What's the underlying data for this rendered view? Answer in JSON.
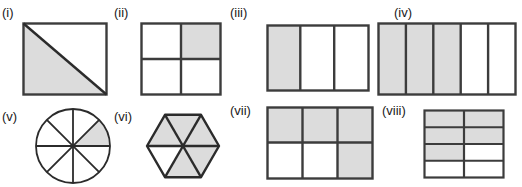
{
  "page": {
    "background": "#ffffff",
    "shade_color": "#dcdcdc",
    "stroke_color": "#3c3c3c",
    "label_color": "#1a1a1a"
  },
  "figures": [
    {
      "id": "i",
      "label": "(i)",
      "shape": "square-diagonal",
      "description": "Square divided by a diagonal from top-left to bottom-right; lower-left triangle shaded",
      "total_parts": 2,
      "shaded_parts": 1,
      "fraction": "1/2",
      "shaded": [
        true,
        false
      ]
    },
    {
      "id": "ii",
      "label": "(ii)",
      "shape": "grid",
      "description": "Square divided into a 2 by 2 grid; top-right cell shaded",
      "columns": 2,
      "rows": 2,
      "total_parts": 4,
      "shaded_parts": 1,
      "fraction": "1/4",
      "shaded": [
        false,
        true,
        false,
        false
      ]
    },
    {
      "id": "iii",
      "label": "(iii)",
      "shape": "grid",
      "description": "Rectangle divided into 3 vertical strips; leftmost strip shaded",
      "columns": 3,
      "rows": 1,
      "total_parts": 3,
      "shaded_parts": 1,
      "fraction": "1/3",
      "shaded": [
        true,
        false,
        false
      ]
    },
    {
      "id": "iv",
      "label": "(iv)",
      "shape": "grid",
      "description": "Rectangle divided into 5 vertical strips; first three strips shaded",
      "columns": 5,
      "rows": 1,
      "total_parts": 5,
      "shaded_parts": 3,
      "fraction": "3/5",
      "shaded": [
        true,
        true,
        true,
        false,
        false
      ]
    },
    {
      "id": "v",
      "label": "(v)",
      "shape": "circle-sectors",
      "description": "Circle divided into 8 equal sectors; one sector shaded",
      "total_parts": 8,
      "shaded_parts": 1,
      "fraction": "1/8",
      "shaded": [
        true,
        false,
        false,
        false,
        false,
        false,
        false,
        false
      ]
    },
    {
      "id": "vi",
      "label": "(vi)",
      "shape": "hexagon-triangles",
      "description": "Regular hexagon divided into 6 triangles; five shaded, the lower-left triangle unshaded",
      "total_parts": 6,
      "shaded_parts": 5,
      "fraction": "5/6",
      "shaded": [
        true,
        true,
        true,
        true,
        false,
        true
      ]
    },
    {
      "id": "vii",
      "label": "(vii)",
      "shape": "grid",
      "description": "Rectangle divided into 3 columns by 2 rows; whole top row and bottom-right cell shaded",
      "columns": 3,
      "rows": 2,
      "total_parts": 6,
      "shaded_parts": 4,
      "fraction": "4/6",
      "shaded": [
        true,
        true,
        true,
        false,
        false,
        true
      ]
    },
    {
      "id": "viii",
      "label": "(viii)",
      "shape": "grid",
      "description": "Rectangle divided into 2 columns by 4 rows; top two rows and third-row left cell shaded",
      "columns": 2,
      "rows": 4,
      "total_parts": 8,
      "shaded_parts": 5,
      "fraction": "5/8",
      "shaded": [
        true,
        true,
        true,
        true,
        true,
        false,
        false,
        false
      ]
    }
  ]
}
